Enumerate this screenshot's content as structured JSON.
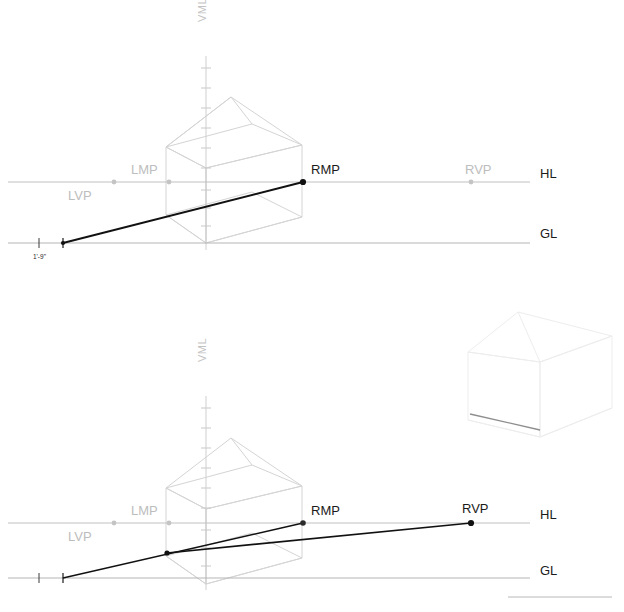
{
  "figure": {
    "title_visible": false,
    "background_color": "#ffffff",
    "colors": {
      "active_line": "#111111",
      "construction_line": "#d9d9d9",
      "house_wire": "#d2d2d2",
      "house_wire_faint": "#ececec",
      "reference_line": "#bcbcbc",
      "label_active": "#1b1b1b",
      "label_inactive": "#bdbdbd",
      "axis_label": "#c3c3c3",
      "tick": "#c9c9c9"
    }
  },
  "panels": [
    {
      "id": "upper-panel",
      "name": "upper-perspective-diagram",
      "reference_lines": [
        {
          "name": "horizon-line",
          "abbr": "HL",
          "y": 182,
          "x1": 8,
          "x2": 530
        },
        {
          "name": "ground-line",
          "abbr": "GL",
          "y": 243,
          "x1": 8,
          "x2": 530
        }
      ],
      "axis": {
        "name": "vertical-measuring-line",
        "abbr": "VML",
        "x": 206,
        "y_top": 18,
        "y_bottom": 250
      },
      "points": [
        {
          "abbr": "LVP",
          "name": "left-vanishing-point",
          "x": 114,
          "y": 182,
          "state": "inactive",
          "label_x": 68,
          "label_y": 200
        },
        {
          "abbr": "LMP",
          "name": "left-measuring-point",
          "x": 169,
          "y": 182,
          "state": "inactive",
          "label_x": 131,
          "label_y": 174
        },
        {
          "abbr": "RMP",
          "name": "right-measuring-point",
          "x": 303,
          "y": 182,
          "state": "active",
          "label_x": 311,
          "label_y": 174
        },
        {
          "abbr": "RVP",
          "name": "right-vanishing-point",
          "x": 471,
          "y": 182,
          "state": "inactive",
          "label_x": 465,
          "label_y": 174
        }
      ],
      "measure_marks": [
        {
          "name": "scale-tick-zero",
          "x": 39,
          "y": 243
        },
        {
          "name": "scale-tick-measure",
          "x": 63,
          "y": 243
        }
      ],
      "dimension": {
        "name": "dimension-label",
        "text": "1'-9\"",
        "x": 33,
        "y": 258
      },
      "measure_lines": [
        {
          "name": "rmp-measure-line",
          "from": [
            63,
            243
          ],
          "to": [
            303,
            182
          ],
          "state": "active"
        }
      ],
      "labels": [
        {
          "abbr": "HL",
          "x": 540,
          "y": 178
        },
        {
          "abbr": "GL",
          "x": 540,
          "y": 238
        }
      ],
      "house": {
        "name": "house-wireframe-main",
        "state": "construction"
      }
    },
    {
      "id": "lower-panel",
      "name": "lower-perspective-diagram",
      "reference_lines": [
        {
          "name": "horizon-line",
          "abbr": "HL",
          "y": 523,
          "x1": 8,
          "x2": 530
        },
        {
          "name": "ground-line",
          "abbr": "GL",
          "y": 578,
          "x1": 8,
          "x2": 530
        }
      ],
      "axis": {
        "name": "vertical-measuring-line",
        "abbr": "VML",
        "x": 206,
        "y_top": 355,
        "y_bottom": 585
      },
      "points": [
        {
          "abbr": "LVP",
          "name": "left-vanishing-point",
          "x": 114,
          "y": 523,
          "state": "inactive",
          "label_x": 68,
          "label_y": 541
        },
        {
          "abbr": "LMP",
          "name": "left-measuring-point",
          "x": 169,
          "y": 523,
          "state": "inactive",
          "label_x": 131,
          "label_y": 515
        },
        {
          "abbr": "RMP",
          "name": "right-measuring-point",
          "x": 303,
          "y": 523,
          "state": "active",
          "label_x": 311,
          "label_y": 515
        },
        {
          "abbr": "RVP",
          "name": "right-vanishing-point",
          "x": 471,
          "y": 523,
          "state": "active",
          "label_x": 462,
          "label_y": 513
        }
      ],
      "measure_marks": [
        {
          "name": "scale-tick-zero",
          "x": 39,
          "y": 578
        },
        {
          "name": "scale-tick-measure",
          "x": 63,
          "y": 578
        }
      ],
      "node": {
        "name": "corner-node",
        "x": 167,
        "y": 553
      },
      "measure_lines": [
        {
          "name": "rmp-measure-line",
          "from": [
            63,
            578
          ],
          "to": [
            303,
            523
          ],
          "state": "active"
        },
        {
          "name": "rvp-projection-line",
          "from": [
            167,
            553
          ],
          "to": [
            471,
            523
          ],
          "state": "active"
        }
      ],
      "labels": [
        {
          "abbr": "HL",
          "x": 540,
          "y": 519
        },
        {
          "abbr": "GL",
          "x": 540,
          "y": 575
        }
      ],
      "house": {
        "name": "house-wireframe-main",
        "state": "construction"
      },
      "inset_house": {
        "name": "house-wireframe-result",
        "state": "faint"
      },
      "footer_rule": {
        "name": "footer-rule",
        "x1": 508,
        "x2": 612,
        "y": 597
      }
    }
  ],
  "legend": {
    "abbreviations": [
      {
        "abbr": "HL",
        "meaning": "Horizon Line"
      },
      {
        "abbr": "GL",
        "meaning": "Ground Line"
      },
      {
        "abbr": "VML",
        "meaning": "Vertical Measuring Line"
      },
      {
        "abbr": "LVP",
        "meaning": "Left Vanishing Point"
      },
      {
        "abbr": "RVP",
        "meaning": "Right Vanishing Point"
      },
      {
        "abbr": "LMP",
        "meaning": "Left Measuring Point"
      },
      {
        "abbr": "RMP",
        "meaning": "Right Measuring Point"
      }
    ]
  }
}
